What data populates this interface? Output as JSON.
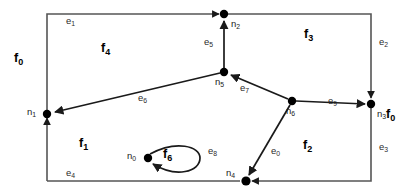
{
  "diagram": {
    "canvas": {
      "width": 416,
      "height": 195
    },
    "style": {
      "background": "#ffffff",
      "stroke": "#3a3a3a",
      "outer_stroke": "#555555",
      "node_fill": "#000000",
      "label_color": "#000000",
      "edge_label_color": "#2b2b2b"
    },
    "nodes": [
      {
        "id": "n0",
        "label": "n",
        "sub": "0",
        "x": 148,
        "y": 158,
        "label_x": 127,
        "label_y": 152,
        "r": 4.2
      },
      {
        "id": "n1",
        "label": "n",
        "sub": "1",
        "x": 47,
        "y": 114,
        "label_x": 27,
        "label_y": 108,
        "r": 4.2
      },
      {
        "id": "n2",
        "label": "n",
        "sub": "2",
        "x": 224,
        "y": 14,
        "label_x": 231,
        "label_y": 19,
        "r": 4.2
      },
      {
        "id": "n3",
        "label": "n",
        "sub": "3",
        "x": 371,
        "y": 104,
        "label_x": 377,
        "label_y": 109,
        "r": 4.2
      },
      {
        "id": "n4",
        "label": "n",
        "sub": "4",
        "x": 246,
        "y": 181,
        "label_x": 226,
        "label_y": 172,
        "r": 4.6
      },
      {
        "id": "n5",
        "label": "n",
        "sub": "5",
        "x": 224,
        "y": 72,
        "label_x": 217,
        "label_y": 78,
        "r": 4.2
      },
      {
        "id": "n6",
        "label": "n",
        "sub": "6",
        "x": 292,
        "y": 101,
        "label_x": 287,
        "label_y": 107,
        "r": 4.2
      }
    ],
    "edges": [
      {
        "id": "e0",
        "label": "e",
        "sub": "0",
        "label_x": 271,
        "label_y": 151,
        "from": "n6",
        "to": "n4"
      },
      {
        "id": "e1",
        "label": "e",
        "sub": "1",
        "label_x": 69,
        "label_y": 20,
        "from": "n1",
        "to": "n2"
      },
      {
        "id": "e2",
        "label": "e",
        "sub": "2",
        "label_x": 381,
        "label_y": 41,
        "from": "n2",
        "to": "n3"
      },
      {
        "id": "e3",
        "label": "e",
        "sub": "3",
        "label_x": 381,
        "label_y": 146,
        "from": "n3",
        "to": "n4"
      },
      {
        "id": "e4",
        "label": "e",
        "sub": "4",
        "label_x": 68,
        "label_y": 172,
        "from": "n1",
        "to": "n4"
      },
      {
        "id": "e5",
        "label": "e",
        "sub": "5",
        "label_x": 206,
        "label_y": 40,
        "from": "n5",
        "to": "n2"
      },
      {
        "id": "e6",
        "label": "e",
        "sub": "6",
        "label_x": 140,
        "label_y": 97,
        "from": "n5",
        "to": "n1"
      },
      {
        "id": "e7",
        "label": "e",
        "sub": "7",
        "label_x": 241,
        "label_y": 87,
        "from": "n6",
        "to": "n5"
      },
      {
        "id": "e8",
        "label": "e",
        "sub": "8",
        "label_x": 210,
        "label_y": 150,
        "from": "n0",
        "to": "n0"
      },
      {
        "id": "e9",
        "label": "e",
        "sub": "9",
        "label_x": 330,
        "label_y": 100,
        "from": "n6",
        "to": "n3"
      }
    ],
    "faces": [
      {
        "id": "f0",
        "label": "f",
        "sub": "0",
        "label_x": 18,
        "label_y": 58
      },
      {
        "id": "f0b",
        "label": "f",
        "sub": "0",
        "label_x": 389,
        "label_y": 114
      },
      {
        "id": "f1",
        "label": "f",
        "sub": "1",
        "label_x": 82,
        "label_y": 143
      },
      {
        "id": "f2",
        "label": "f",
        "sub": "2",
        "label_x": 306,
        "label_y": 145
      },
      {
        "id": "f3",
        "label": "f",
        "sub": "3",
        "label_x": 307,
        "label_y": 34
      },
      {
        "id": "f4",
        "label": "f",
        "sub": "4",
        "label_x": 104,
        "label_y": 48
      },
      {
        "id": "f6",
        "label": "f",
        "sub": "6",
        "label_x": 165,
        "label_y": 152
      }
    ]
  }
}
